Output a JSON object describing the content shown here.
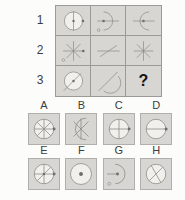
{
  "matrix": {
    "row_labels": [
      "1",
      "2",
      "3"
    ],
    "rows": [
      [
        "circle-vline-dot",
        "arc-right-bulge-hline-dot",
        "arc-left-bulge-hline-dot"
      ],
      [
        "asterisk-right-dot",
        "hline-diagonal",
        "asterisk"
      ],
      [
        "circle-diagonal-dot",
        "arc-diagonal",
        "question-mark"
      ]
    ],
    "question_mark": "?"
  },
  "options": [
    {
      "label": "A",
      "figure": "circle-asterisk-right-dot"
    },
    {
      "label": "B",
      "figure": "halfcircle-asterisk"
    },
    {
      "label": "C",
      "figure": "circle-cross-right-dot"
    },
    {
      "label": "D",
      "figure": "circle-hline-right-dot"
    },
    {
      "label": "E",
      "figure": "circle-cross-diagonal-dots"
    },
    {
      "label": "F",
      "figure": "circle-center-dot"
    },
    {
      "label": "G",
      "figure": "arc-right-bulge-hline-center-dot"
    },
    {
      "label": "H",
      "figure": "circle-diagonal-cross"
    }
  ],
  "colors": {
    "page_bg": "#fcfcfb",
    "cell_bg": "#d7d6d2",
    "tile_border": "#b0afab",
    "grid_line": "#9b9a96",
    "stroke": "#8a8984",
    "dot": "#6e6d69",
    "fig_fill": "#f1f0ec",
    "label_text": "#3c3c3c",
    "qmark": "#141414"
  }
}
